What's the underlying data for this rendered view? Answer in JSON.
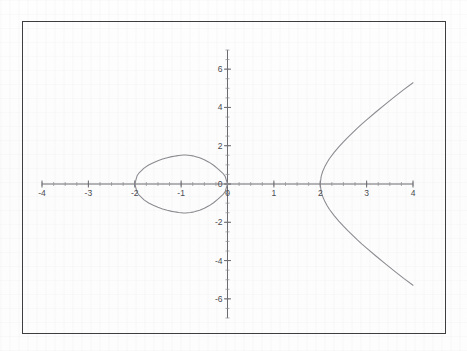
{
  "figure": {
    "border_color": "#3d3d42",
    "background_color": "#fdfdfd"
  },
  "chart_data": {
    "type": "line",
    "title": "",
    "subtitle": "",
    "xlabel": "",
    "ylabel": "",
    "xlim": [
      -4,
      4
    ],
    "ylim": [
      -7,
      7
    ],
    "grid": false,
    "legend": null,
    "axis_color": "#6a6a70",
    "curve_color": "#8a8a90",
    "x_ticks": [
      -4,
      -3,
      -2,
      -1,
      0,
      1,
      2,
      3,
      4
    ],
    "x_tick_labels": [
      "-4",
      "-3",
      "-2",
      "-1",
      "0",
      "1",
      "2",
      "3",
      "4"
    ],
    "y_ticks": [
      -6,
      -4,
      -2,
      0,
      2,
      4,
      6
    ],
    "y_tick_labels": [
      "-6",
      "-4",
      "-2",
      "0",
      "2",
      "4",
      "6"
    ],
    "x_minor_step": 0.25,
    "y_minor_step": 0.5,
    "equation": "y^2 = x^3 - 4x",
    "roots": [
      -2,
      0,
      2
    ],
    "series": [
      {
        "name": "oval-component",
        "description": "closed oval branch spanning x from -2 to 0",
        "x_range": [
          -2,
          0
        ],
        "y_extrema": [
          -1.53,
          1.53
        ]
      },
      {
        "name": "unbounded-component",
        "description": "open branch starting at x = 2 extending to x = 4",
        "x_range": [
          2,
          4
        ],
        "y_extrema": [
          -6.93,
          6.93
        ]
      }
    ],
    "points": {
      "oval_upper": [
        [
          -2.0,
          0.0
        ],
        [
          -1.95,
          0.43
        ],
        [
          -1.9,
          0.6
        ],
        [
          -1.8,
          0.83
        ],
        [
          -1.7,
          0.99
        ],
        [
          -1.6,
          1.11
        ],
        [
          -1.5,
          1.22
        ],
        [
          -1.4,
          1.3
        ],
        [
          -1.3,
          1.37
        ],
        [
          -1.2,
          1.43
        ],
        [
          -1.15,
          1.45
        ],
        [
          -1.1,
          1.47
        ],
        [
          -1.05,
          1.49
        ],
        [
          -1.0,
          1.5
        ],
        [
          -0.95,
          1.51
        ],
        [
          -0.9,
          1.51
        ],
        [
          -0.85,
          1.5
        ],
        [
          -0.8,
          1.49
        ],
        [
          -0.75,
          1.47
        ],
        [
          -0.7,
          1.44
        ],
        [
          -0.6,
          1.37
        ],
        [
          -0.5,
          1.27
        ],
        [
          -0.4,
          1.14
        ],
        [
          -0.3,
          0.98
        ],
        [
          -0.2,
          0.78
        ],
        [
          -0.1,
          0.56
        ],
        [
          -0.05,
          0.4
        ],
        [
          0.0,
          0.0
        ]
      ],
      "branch_upper": [
        [
          2.0,
          0.0
        ],
        [
          2.02,
          0.4
        ],
        [
          2.05,
          0.64
        ],
        [
          2.1,
          0.92
        ],
        [
          2.15,
          1.14
        ],
        [
          2.2,
          1.33
        ],
        [
          2.3,
          1.65
        ],
        [
          2.4,
          1.94
        ],
        [
          2.5,
          2.2
        ],
        [
          2.6,
          2.45
        ],
        [
          2.7,
          2.69
        ],
        [
          2.8,
          2.92
        ],
        [
          2.9,
          3.14
        ],
        [
          3.0,
          3.35
        ],
        [
          3.2,
          3.76
        ],
        [
          3.4,
          4.16
        ],
        [
          3.6,
          4.55
        ],
        [
          3.8,
          4.93
        ],
        [
          4.0,
          5.29
        ]
      ]
    }
  }
}
